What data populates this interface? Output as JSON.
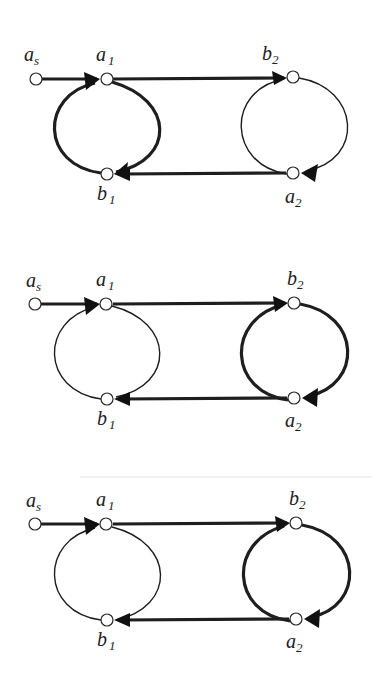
{
  "figure": {
    "panels": [
      {
        "id": "panel-1",
        "highlighted_loop": "left",
        "nodes": {
          "as": {
            "label": "a",
            "sub": "s"
          },
          "a1": {
            "label": "a",
            "sub": "1"
          },
          "b1": {
            "label": "b",
            "sub": "1"
          },
          "b2": {
            "label": "b",
            "sub": "2"
          },
          "a2": {
            "label": "a",
            "sub": "2"
          }
        },
        "edges": [
          {
            "from": "as",
            "to": "a1",
            "weight": "thick"
          },
          {
            "from": "a1",
            "to": "b2",
            "weight": "thick"
          },
          {
            "from": "a1",
            "to": "b1",
            "via": "left-loop-right-arc",
            "weight": "thick"
          },
          {
            "from": "b1",
            "to": "a1",
            "via": "left-loop-left-arc",
            "weight": "thick"
          },
          {
            "from": "b2",
            "to": "a2",
            "via": "right-loop-right-arc",
            "weight": "thin"
          },
          {
            "from": "a2",
            "to": "b2",
            "via": "right-loop-left-arc",
            "weight": "thin"
          },
          {
            "from": "a2",
            "to": "b1",
            "weight": "thick"
          }
        ]
      },
      {
        "id": "panel-2",
        "highlighted_loop": "right",
        "nodes": {
          "as": {
            "label": "a",
            "sub": "s"
          },
          "a1": {
            "label": "a",
            "sub": "1"
          },
          "b1": {
            "label": "b",
            "sub": "1"
          },
          "b2": {
            "label": "b",
            "sub": "2"
          },
          "a2": {
            "label": "a",
            "sub": "2"
          }
        },
        "edges": [
          {
            "from": "as",
            "to": "a1",
            "weight": "thick"
          },
          {
            "from": "a1",
            "to": "b2",
            "weight": "thick"
          },
          {
            "from": "a1",
            "to": "b1",
            "via": "left-loop-right-arc",
            "weight": "thin"
          },
          {
            "from": "b1",
            "to": "a1",
            "via": "left-loop-left-arc",
            "weight": "thin"
          },
          {
            "from": "b2",
            "to": "a2",
            "via": "right-loop-right-arc",
            "weight": "thick"
          },
          {
            "from": "a2",
            "to": "b2",
            "via": "right-loop-left-arc",
            "weight": "thick"
          },
          {
            "from": "a2",
            "to": "b1",
            "weight": "thick"
          }
        ]
      },
      {
        "id": "panel-3",
        "highlighted_loop": "right",
        "nodes": {
          "as": {
            "label": "a",
            "sub": "s"
          },
          "a1": {
            "label": "a",
            "sub": "1"
          },
          "b1": {
            "label": "b",
            "sub": "1"
          },
          "b2": {
            "label": "b",
            "sub": "2"
          },
          "a2": {
            "label": "a",
            "sub": "2"
          }
        },
        "edges": [
          {
            "from": "as",
            "to": "a1",
            "weight": "thick"
          },
          {
            "from": "a1",
            "to": "b2",
            "weight": "thick"
          },
          {
            "from": "a1",
            "to": "b1",
            "via": "left-loop-right-arc",
            "weight": "thin"
          },
          {
            "from": "b1",
            "to": "a1",
            "via": "left-loop-left-arc",
            "weight": "thin"
          },
          {
            "from": "b2",
            "to": "a2",
            "via": "right-loop-right-arc",
            "weight": "thick"
          },
          {
            "from": "a2",
            "to": "b2",
            "via": "right-loop-left-arc",
            "weight": "thick"
          },
          {
            "from": "a2",
            "to": "b1",
            "weight": "thick"
          }
        ]
      }
    ]
  }
}
